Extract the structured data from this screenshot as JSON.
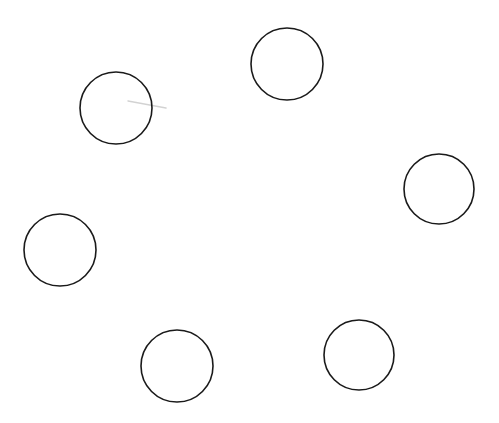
{
  "canvas": {
    "width": 499,
    "height": 423,
    "background": "#ffffff"
  },
  "style": {
    "stroke": "#1a1a1a",
    "stroke_width": 1.6,
    "fill": "none"
  },
  "circles": [
    {
      "id": "circle-1",
      "cx": 116,
      "cy": 108,
      "r": 36
    },
    {
      "id": "circle-2",
      "cx": 287,
      "cy": 64,
      "r": 36
    },
    {
      "id": "circle-3",
      "cx": 439,
      "cy": 189,
      "r": 35
    },
    {
      "id": "circle-4",
      "cx": 60,
      "cy": 250,
      "r": 36
    },
    {
      "id": "circle-5",
      "cx": 177,
      "cy": 366,
      "r": 36
    },
    {
      "id": "circle-6",
      "cx": 359,
      "cy": 355,
      "r": 35
    }
  ],
  "marks": [
    {
      "id": "faint-stroke",
      "x1": 128,
      "y1": 101,
      "x2": 166,
      "y2": 108,
      "color": "#c8c8c8",
      "width": 1.5
    }
  ]
}
